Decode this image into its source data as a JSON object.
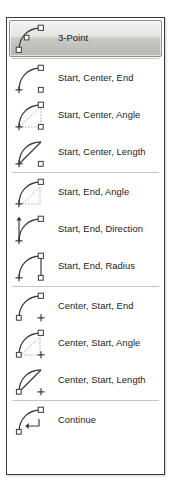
{
  "menu": {
    "name": "arc-tool-dropdown",
    "selected_item": "3-Point",
    "accent_color": "#b9b9b4",
    "border_color": "#3a3a3a",
    "separator_color": "#c6c6c4",
    "text_color": "#1c1c1c",
    "groups": [
      {
        "items": [
          {
            "label": "3-Point",
            "icon": "arc-3-point-icon",
            "selected": true
          }
        ]
      },
      {
        "items": [
          {
            "label": "Start, Center, End",
            "icon": "arc-start-center-end-icon",
            "selected": false
          },
          {
            "label": "Start, Center, Angle",
            "icon": "arc-start-center-angle-icon",
            "selected": false
          },
          {
            "label": "Start, Center, Length",
            "icon": "arc-start-center-length-icon",
            "selected": false
          }
        ]
      },
      {
        "items": [
          {
            "label": "Start, End, Angle",
            "icon": "arc-start-end-angle-icon",
            "selected": false
          },
          {
            "label": "Start, End, Direction",
            "icon": "arc-start-end-direction-icon",
            "selected": false
          },
          {
            "label": "Start, End, Radius",
            "icon": "arc-start-end-radius-icon",
            "selected": false
          }
        ]
      },
      {
        "items": [
          {
            "label": "Center, Start, End",
            "icon": "arc-center-start-end-icon",
            "selected": false
          },
          {
            "label": "Center, Start, Angle",
            "icon": "arc-center-start-angle-icon",
            "selected": false
          },
          {
            "label": "Center, Start, Length",
            "icon": "arc-center-start-length-icon",
            "selected": false
          }
        ]
      },
      {
        "items": [
          {
            "label": "Continue",
            "icon": "arc-continue-icon",
            "selected": false
          }
        ]
      }
    ]
  }
}
